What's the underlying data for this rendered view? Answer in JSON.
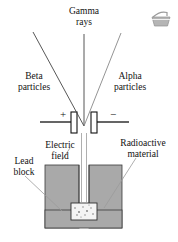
{
  "figure": {
    "background_color": "#ffffff",
    "line_color": "#111111",
    "leader_color": "#8a8a8a",
    "lead_block_color": "#a9a9a9",
    "sample_color": "#f2f2f2",
    "ray_color": "#555555"
  },
  "labels": {
    "gamma": {
      "line1": "Gamma",
      "line2": "rays"
    },
    "beta": {
      "line1": "Beta",
      "line2": "particles"
    },
    "alpha": {
      "line1": "Alpha",
      "line2": "particles"
    },
    "electric_field": {
      "line1": "Electric",
      "line2": "field"
    },
    "lead_block": {
      "line1": "Lead",
      "line2": "block"
    },
    "radioactive_material": {
      "line1": "Radioactive",
      "line2": "material"
    }
  },
  "plates": {
    "positive_sign": "+",
    "negative_sign": "−",
    "positive_name": "positive-plate",
    "negative_name": "negative-plate"
  },
  "icons": {
    "corner": "basket-watermark-icon"
  }
}
